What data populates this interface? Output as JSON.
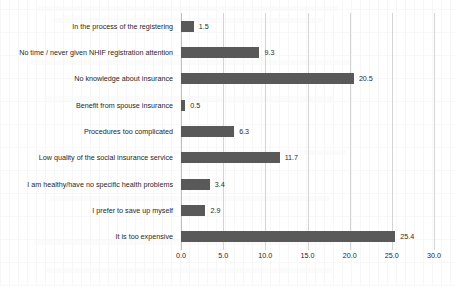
{
  "chart_data": {
    "type": "bar",
    "orientation": "horizontal",
    "title": "",
    "subtitle": "",
    "xlabel": "",
    "ylabel": "",
    "xlim": [
      0.0,
      30.0
    ],
    "xticks": [
      "0.0",
      "5.0",
      "10.0",
      "15.0",
      "20.0",
      "25.0",
      "30.0"
    ],
    "xtick_values": [
      0,
      5,
      10,
      15,
      20,
      25,
      30
    ],
    "grid": "vertical",
    "legend": "none",
    "bar_color": "#595959",
    "gridline_color": "#d4d4d4",
    "categories": [
      "In the process of the registering",
      "No time / never given NHIF registration attention",
      "No knowledge about insurance",
      "Benefit from spouse insurance",
      "Procedures too complicated",
      "Low quality of the social insurance service",
      "I am healthy/have no specific health problems",
      "I prefer to save up myself",
      "It is too expensive"
    ],
    "values": [
      1.5,
      9.3,
      20.5,
      0.5,
      6.3,
      11.7,
      3.4,
      2.9,
      25.4
    ],
    "value_labels": [
      "1.5",
      "9.3",
      "20.5",
      "0.5",
      "6.3",
      "11.7",
      "3.4",
      "2.9",
      "25.4"
    ]
  }
}
